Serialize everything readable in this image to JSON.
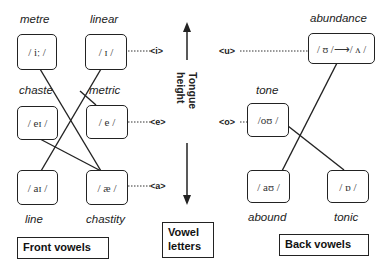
{
  "front": {
    "label": "Front vowels",
    "words": {
      "metre": "metre",
      "linear": "linear",
      "chaste": "chaste",
      "metric": "metric",
      "line": "line",
      "chastity": "chastity"
    },
    "vowels": {
      "i_long": "/ iː /",
      "i_short": "/ ɪ /",
      "ei": "/ eɪ /",
      "e": "/ e /",
      "ai": "/ aɪ /",
      "ae": "/ æ /"
    }
  },
  "center": {
    "label_line1": "Vowel",
    "label_line2": "letters",
    "axis": "Tongue height",
    "letters": {
      "i": "<i>",
      "e": "<e>",
      "a": "<a>",
      "u": "<u>",
      "o": "<o>"
    }
  },
  "back": {
    "label": "Back vowels",
    "words": {
      "abundance": "abundance",
      "tone": "tone",
      "abound": "abound",
      "tonic": "tonic"
    },
    "vowels": {
      "u_to_v": "/ ʊ /⟶/ ʌ /",
      "ou": "/oʊ /",
      "au": "/ aʊ /",
      "o_short": "/ ɒ /"
    }
  }
}
